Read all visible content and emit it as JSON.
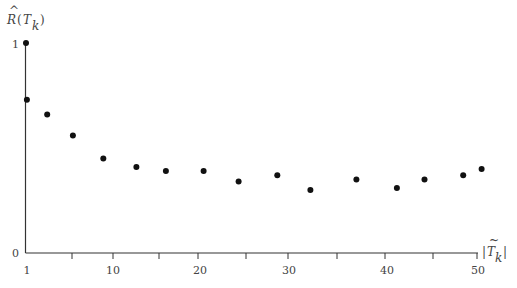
{
  "chart_data": {
    "type": "scatter",
    "title": "",
    "ylabel": "R̂(T_k)",
    "xlabel": "|T̃_k|",
    "xlim": [
      1,
      50
    ],
    "ylim": [
      0,
      1
    ],
    "grid": false,
    "legend": null,
    "x_ticks": [
      1,
      5,
      10,
      15,
      20,
      25,
      30,
      35,
      40,
      45,
      50
    ],
    "x_tick_labels": [
      "1",
      "",
      "10",
      "",
      "20",
      "",
      "30",
      "",
      "40",
      "",
      "50"
    ],
    "y_tick_labels": [
      "0",
      "1"
    ],
    "series": [
      {
        "name": "R̂(T_k)",
        "x": [
          1,
          1.1,
          3.3,
          6.1,
          9.4,
          13.0,
          16.2,
          20.3,
          24.1,
          28.3,
          31.9,
          36.9,
          41.3,
          44.3,
          48.5,
          50.5
        ],
        "y": [
          1.0,
          0.73,
          0.66,
          0.56,
          0.45,
          0.41,
          0.39,
          0.39,
          0.34,
          0.37,
          0.3,
          0.35,
          0.31,
          0.35,
          0.37,
          0.4
        ]
      }
    ]
  },
  "labels": {
    "y_axis": {
      "base": "R",
      "hat": "^",
      "open": "(",
      "var": "T",
      "sub": "k",
      "close": ")"
    },
    "x_axis": {
      "bar_l": "|",
      "var": "T",
      "tilde": "~",
      "sub": "k",
      "bar_r": "|"
    },
    "y_tick_0": "0",
    "y_tick_1": "1",
    "x_tick_1": "1",
    "x_tick_10": "10",
    "x_tick_20": "20",
    "x_tick_30": "30",
    "x_tick_40": "40",
    "x_tick_50": "50"
  }
}
